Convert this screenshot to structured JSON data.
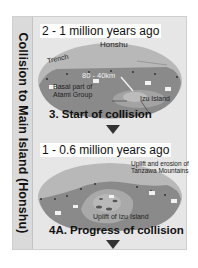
{
  "sidebar": {
    "title": "Collision to Main Island (Honshu)"
  },
  "stages": [
    {
      "period": "2 - 1 million years ago",
      "labels": {
        "honshu": "Honshu",
        "trench": "Trench",
        "distance": "80 - 40km",
        "basal": "Basal part of",
        "basal2": "Atami Group",
        "izu": "Izu Island"
      },
      "caption": "3. Start of collision"
    },
    {
      "period": "1 - 0.6 million years ago",
      "labels": {
        "uplift_tanzawa": "Uplift and erosion of",
        "uplift_tanzawa2": "Tanzawa Mountains",
        "uplift_izu": "Uplift of Izu Island"
      },
      "caption": "4A. Progress of collision"
    }
  ],
  "colors": {
    "panel": "#e6e6e6",
    "land": "#b8b8b8",
    "sea": "#8a8a8a",
    "island": "#a9a9a9"
  }
}
